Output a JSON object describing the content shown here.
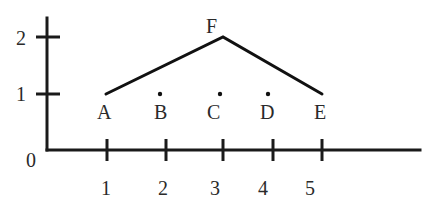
{
  "diagram": {
    "type": "coordinate-plot",
    "origin_label": "0",
    "x_axis": {
      "ticks": [
        {
          "value": 1,
          "label": "1",
          "px": 107
        },
        {
          "value": 2,
          "label": "2",
          "px": 166
        },
        {
          "value": 3,
          "label": "3",
          "px": 223
        },
        {
          "value": 4,
          "label": "4",
          "px": 273
        },
        {
          "value": 5,
          "label": "5",
          "px": 322
        }
      ]
    },
    "y_axis": {
      "ticks": [
        {
          "value": 1,
          "label": "1",
          "py": 94
        },
        {
          "value": 2,
          "label": "2",
          "py": 37
        }
      ]
    },
    "points": [
      {
        "label": "A",
        "x": 1,
        "y": 1,
        "marker": "none"
      },
      {
        "label": "B",
        "x": 2,
        "y": 1,
        "marker": "dot"
      },
      {
        "label": "C",
        "x": 3,
        "y": 1,
        "marker": "dot"
      },
      {
        "label": "D",
        "x": 4,
        "y": 1,
        "marker": "dot"
      },
      {
        "label": "E",
        "x": 5,
        "y": 1,
        "marker": "none"
      },
      {
        "label": "F",
        "x": 3,
        "y": 2,
        "marker": "none"
      }
    ],
    "segments": [
      {
        "from": "A",
        "to": "F"
      },
      {
        "from": "F",
        "to": "E"
      }
    ]
  },
  "labels": {
    "origin": "0",
    "xt1": "1",
    "xt2": "2",
    "xt3": "3",
    "xt4": "4",
    "xt5": "5",
    "yt1": "1",
    "yt2": "2",
    "A": "A",
    "B": "B",
    "C": "C",
    "D": "D",
    "E": "E",
    "F": "F"
  }
}
